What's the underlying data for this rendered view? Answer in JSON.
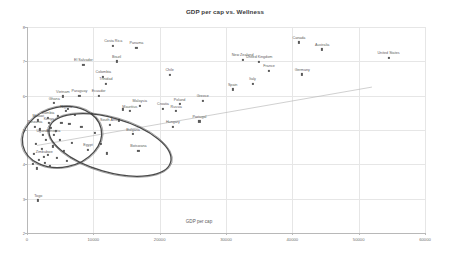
{
  "chart_data": {
    "type": "scatter",
    "title": "GDP per cap vs. Wellness",
    "xlabel": "GDP per cap",
    "ylabel": "",
    "xlim": [
      0,
      60000
    ],
    "ylim": [
      2,
      8
    ],
    "xticks": [
      "0",
      "10000",
      "20000",
      "30000",
      "40000",
      "50000",
      "60000"
    ],
    "xtick_values": [
      0,
      10000,
      20000,
      30000,
      40000,
      50000,
      60000
    ],
    "yticks": [
      "8",
      "7",
      "6",
      "5",
      "4",
      "3",
      "2"
    ],
    "ytick_values": [
      8,
      7,
      6,
      5,
      4,
      3,
      2
    ],
    "grid": true,
    "legend": "none",
    "trendline": {
      "x0": 1500,
      "y0": 4.55,
      "x1": 52000,
      "y1": 6.25
    },
    "points": [
      {
        "label": "Canada",
        "x": 41000,
        "y": 7.55
      },
      {
        "label": "Australia",
        "x": 44500,
        "y": 7.35
      },
      {
        "label": "United States",
        "x": 54500,
        "y": 7.1
      },
      {
        "label": "New Zealand",
        "x": 32500,
        "y": 7.05
      },
      {
        "label": "United Kingdom",
        "x": 35000,
        "y": 6.98
      },
      {
        "label": "France",
        "x": 36500,
        "y": 6.72
      },
      {
        "label": "Germany",
        "x": 41500,
        "y": 6.62
      },
      {
        "label": "Italy",
        "x": 34000,
        "y": 6.35
      },
      {
        "label": "Spain",
        "x": 31000,
        "y": 6.18
      },
      {
        "label": "Costa Rica",
        "x": 13000,
        "y": 7.45
      },
      {
        "label": "Panama",
        "x": 16500,
        "y": 7.4
      },
      {
        "label": "Brazil",
        "x": 13500,
        "y": 7.0
      },
      {
        "label": "El Salvador",
        "x": 8500,
        "y": 6.9
      },
      {
        "label": "Chile",
        "x": 21500,
        "y": 6.6
      },
      {
        "label": "Colombia",
        "x": 11500,
        "y": 6.55
      },
      {
        "label": "Trinidad",
        "x": 11900,
        "y": 6.35
      },
      {
        "label": "Ecuador",
        "x": 10800,
        "y": 6.0
      },
      {
        "label": "Paraguay",
        "x": 7900,
        "y": 6.0
      },
      {
        "label": "Vietnam",
        "x": 5400,
        "y": 5.98
      },
      {
        "label": "Greece",
        "x": 26500,
        "y": 5.85
      },
      {
        "label": "Poland",
        "x": 23000,
        "y": 5.75
      },
      {
        "label": "Croatia",
        "x": 20500,
        "y": 5.62
      },
      {
        "label": "Russia",
        "x": 22500,
        "y": 5.55
      },
      {
        "label": "Malaysia",
        "x": 17000,
        "y": 5.7
      },
      {
        "label": "Mauritius",
        "x": 15500,
        "y": 5.55
      },
      {
        "label": "Portugal",
        "x": 26000,
        "y": 5.25
      },
      {
        "label": "Hungary",
        "x": 22000,
        "y": 5.1
      },
      {
        "label": "Bulgaria",
        "x": 16000,
        "y": 4.88
      },
      {
        "label": "South Africa",
        "x": 12500,
        "y": 5.15
      },
      {
        "label": "Botswana",
        "x": 16800,
        "y": 4.4
      },
      {
        "label": "Nigeria",
        "x": 5900,
        "y": 5.55
      },
      {
        "label": "Ghana",
        "x": 4100,
        "y": 5.78
      },
      {
        "label": "Zambia",
        "x": 3200,
        "y": 5.35
      },
      {
        "label": "Malawi",
        "x": 1700,
        "y": 5.28
      },
      {
        "label": "Tanzania",
        "x": 1200,
        "y": 5.1
      },
      {
        "label": "Ethiopia",
        "x": 4000,
        "y": 4.85
      },
      {
        "label": "Uganda",
        "x": 2400,
        "y": 4.85
      },
      {
        "label": "Kenya",
        "x": 3300,
        "y": 5.2
      },
      {
        "label": "Egypt",
        "x": 9200,
        "y": 4.42
      },
      {
        "label": "Zimbabwe",
        "x": 2600,
        "y": 4.22
      },
      {
        "label": "Togo",
        "x": 1700,
        "y": 2.95
      }
    ],
    "unlabeled_points": [
      {
        "x": 6200,
        "y": 5.62
      },
      {
        "x": 7200,
        "y": 5.45
      },
      {
        "x": 4700,
        "y": 5.4
      },
      {
        "x": 5200,
        "y": 5.2
      },
      {
        "x": 6400,
        "y": 5.18
      },
      {
        "x": 3600,
        "y": 5.05
      },
      {
        "x": 2000,
        "y": 5.02
      },
      {
        "x": 4400,
        "y": 4.98
      },
      {
        "x": 8200,
        "y": 5.08
      },
      {
        "x": 2900,
        "y": 4.72
      },
      {
        "x": 5000,
        "y": 4.7
      },
      {
        "x": 6800,
        "y": 4.62
      },
      {
        "x": 1400,
        "y": 4.6
      },
      {
        "x": 3900,
        "y": 4.52
      },
      {
        "x": 2200,
        "y": 4.45
      },
      {
        "x": 5600,
        "y": 4.38
      },
      {
        "x": 1100,
        "y": 4.3
      },
      {
        "x": 3100,
        "y": 4.28
      },
      {
        "x": 4500,
        "y": 4.18
      },
      {
        "x": 1800,
        "y": 4.12
      },
      {
        "x": 6000,
        "y": 4.1
      },
      {
        "x": 2700,
        "y": 4.05
      },
      {
        "x": 900,
        "y": 4.02
      },
      {
        "x": 3400,
        "y": 3.95
      },
      {
        "x": 1500,
        "y": 3.88
      },
      {
        "x": 9800,
        "y": 5.48
      },
      {
        "x": 13800,
        "y": 5.28
      },
      {
        "x": 10200,
        "y": 4.92
      },
      {
        "x": 11200,
        "y": 4.6
      },
      {
        "x": 14500,
        "y": 5.6
      },
      {
        "x": 12000,
        "y": 4.32
      }
    ],
    "annotations": [
      {
        "name": "cluster-ellipse-left",
        "cx": 62,
        "cy": 137,
        "rx": 40,
        "ry": 30,
        "rot": -12
      },
      {
        "name": "cluster-ellipse-right",
        "cx": 110,
        "cy": 145,
        "rx": 63,
        "ry": 27,
        "rot": 16
      }
    ]
  }
}
